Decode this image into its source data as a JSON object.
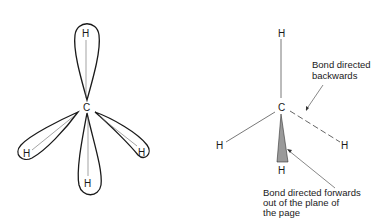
{
  "left_diagram": {
    "title": "Orbital lobes of methane",
    "center_atom": "C",
    "atoms": [
      "H",
      "H",
      "H",
      "H"
    ]
  },
  "right_diagram": {
    "center_atom": "C",
    "atoms": [
      "H",
      "H",
      "H",
      "H"
    ],
    "annotations": {
      "backwards": [
        "Bond directed",
        "backwards"
      ],
      "forwards": [
        "Bond directed forwards",
        "out of the plane of",
        "the page"
      ]
    }
  },
  "colors": {
    "line": "#1a1a1a",
    "thin_line": "#555555",
    "wedge_fill": "#9a9a9a"
  }
}
